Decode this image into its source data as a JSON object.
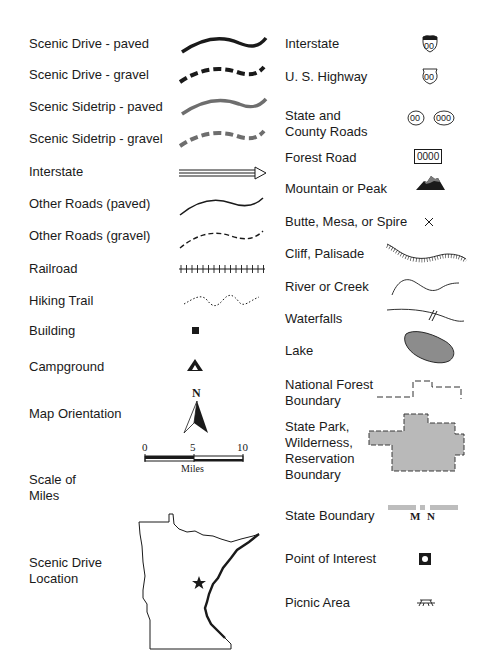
{
  "legend": {
    "left": [
      {
        "label": "Scenic Drive - paved",
        "symbol": "thick-solid-line-black"
      },
      {
        "label": "Scenic Drive - gravel",
        "symbol": "thick-dashed-line-black"
      },
      {
        "label": "Scenic Sidetrip - paved",
        "symbol": "thick-solid-line-gray"
      },
      {
        "label": "Scenic Sidetrip - gravel",
        "symbol": "thick-dashed-line-gray"
      },
      {
        "label": "Interstate",
        "symbol": "double-line-arrow"
      },
      {
        "label": "Other Roads (paved)",
        "symbol": "thin-solid-line"
      },
      {
        "label": "Other Roads (gravel)",
        "symbol": "thin-dashed-line"
      },
      {
        "label": "Railroad",
        "symbol": "railroad-track"
      },
      {
        "label": "Hiking Trail",
        "symbol": "dotted-line"
      },
      {
        "label": "Building",
        "symbol": "small-black-square"
      },
      {
        "label": "Campground",
        "symbol": "tent-triangle"
      },
      {
        "label": "Map Orientation",
        "symbol": "north-arrow"
      },
      {
        "label": "Scale of\nMiles",
        "symbol": "scale-bar"
      },
      {
        "label": "Scenic Drive\nLocation",
        "symbol": "minnesota-outline"
      }
    ],
    "right": [
      {
        "label": "Interstate",
        "symbol": "interstate-shield"
      },
      {
        "label": "U. S. Highway",
        "symbol": "us-highway-shield"
      },
      {
        "label": "State and\nCounty Roads",
        "symbol": "state-county-ovals"
      },
      {
        "label": "Forest Road",
        "symbol": "forest-road-box"
      },
      {
        "label": "Mountain or Peak",
        "symbol": "mountain"
      },
      {
        "label": "Butte, Mesa, or Spire",
        "symbol": "x-mark"
      },
      {
        "label": "Cliff, Palisade",
        "symbol": "hatched-line"
      },
      {
        "label": "River or Creek",
        "symbol": "wavy-line"
      },
      {
        "label": "Waterfalls",
        "symbol": "line-with-hash"
      },
      {
        "label": "Lake",
        "symbol": "gray-blob"
      },
      {
        "label": "National Forest\nBoundary",
        "symbol": "dashed-boundary"
      },
      {
        "label": "State Park,\nWilderness,\nReservation\nBoundary",
        "symbol": "gray-polygon-dashed"
      },
      {
        "label": "State Boundary",
        "symbol": "gray-bar-boundary"
      },
      {
        "label": "Point of Interest",
        "symbol": "square-with-dot"
      },
      {
        "label": "Picnic Area",
        "symbol": "picnic-table"
      }
    ]
  },
  "shields": {
    "interstate": "00",
    "us_highway": "00",
    "state_road": "00",
    "county_road": "000",
    "forest_road": "0000"
  },
  "north_arrow": {
    "letter": "N"
  },
  "scale": {
    "ticks": [
      "0",
      "5",
      "10"
    ],
    "unit": "Miles"
  },
  "state_boundary": {
    "left_state": "M",
    "right_state": "N"
  },
  "colors": {
    "black": "#1a1a1a",
    "sidetrip_gray": "#6e6e6e",
    "lake_fill": "#8c8c8c",
    "park_fill": "#b9b9b9",
    "boundary_gray": "#bdbdbd"
  }
}
